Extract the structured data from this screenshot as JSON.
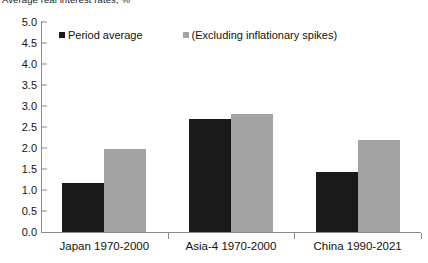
{
  "chart_data": {
    "type": "bar",
    "title": "Average real interest rates, %",
    "xlabel": "",
    "ylabel": "",
    "ylim": [
      0.0,
      5.0
    ],
    "ytick_step": 0.5,
    "grid": false,
    "legend_position": "top-left-inside",
    "categories": [
      "Japan 1970-2000",
      "Asia-4 1970-2000",
      "China 1990-2021"
    ],
    "series": [
      {
        "name": "Period average",
        "color": "#1a1a1a",
        "values": [
          1.17,
          2.69,
          1.42
        ]
      },
      {
        "name": "(Excluding inflationary spikes)",
        "color": "#a3a3a3",
        "values": [
          1.97,
          2.8,
          2.2
        ]
      }
    ],
    "ytick_labels": [
      "0.0",
      "0.5",
      "1.0",
      "1.5",
      "2.0",
      "2.5",
      "3.0",
      "3.5",
      "4.0",
      "4.5",
      "5.0"
    ]
  },
  "colors": {
    "series_dark": "#1a1a1a",
    "series_light": "#a3a3a3",
    "axis": "#8a8a8a",
    "text": "#111111",
    "background": "#ffffff"
  }
}
